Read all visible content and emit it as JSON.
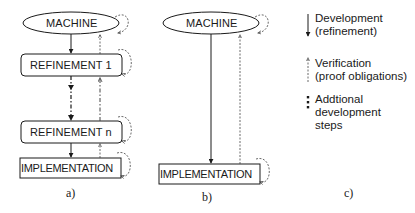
{
  "diagram_a": {
    "caption": "a)",
    "nodes": [
      {
        "id": "machine",
        "label": "MACHINE",
        "shape": "ellipse"
      },
      {
        "id": "refinement1",
        "label": "REFINEMENT 1",
        "shape": "rounded-rect"
      },
      {
        "id": "refinementn",
        "label": "REFINEMENT n",
        "shape": "rounded-rect"
      },
      {
        "id": "implementation",
        "label": "IMPLEMENTATION",
        "shape": "rect"
      }
    ],
    "edges": [
      {
        "from": "machine",
        "to": "refinement1",
        "type": "development"
      },
      {
        "from": "refinement1",
        "to": "machine",
        "type": "verification"
      },
      {
        "from": "refinement1",
        "to": "refinementn",
        "type": "additional-steps"
      },
      {
        "from": "refinementn",
        "to": "refinement1",
        "type": "verification-additional"
      },
      {
        "from": "refinementn",
        "to": "implementation",
        "type": "development"
      },
      {
        "from": "implementation",
        "to": "refinementn",
        "type": "verification"
      }
    ]
  },
  "diagram_b": {
    "caption": "b)",
    "nodes": [
      {
        "id": "machine",
        "label": "MACHINE",
        "shape": "ellipse"
      },
      {
        "id": "implementation",
        "label": "IMPLEMENTATION",
        "shape": "rect"
      }
    ],
    "edges": [
      {
        "from": "machine",
        "to": "implementation",
        "type": "development"
      },
      {
        "from": "implementation",
        "to": "machine",
        "type": "verification"
      }
    ]
  },
  "legend": {
    "caption": "c)",
    "items": [
      {
        "icon": "solid-arrow-down-icon",
        "line1": "Development",
        "line2": "(refinement)"
      },
      {
        "icon": "dotted-arrow-up-icon",
        "line1": "Verification",
        "line2": "(proof obligations)"
      },
      {
        "icon": "dashed-dots-icon",
        "line1": "Addtional",
        "line2": "development",
        "line3": "steps"
      }
    ]
  }
}
